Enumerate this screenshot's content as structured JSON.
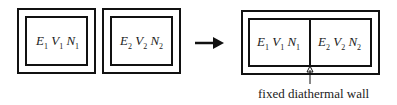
{
  "diagram": {
    "left_systems": [
      {
        "E": "E",
        "E_sub": "1",
        "V": "V",
        "V_sub": "1",
        "N": "N",
        "N_sub": "1"
      },
      {
        "E": "E",
        "E_sub": "2",
        "V": "V",
        "V_sub": "2",
        "N": "N",
        "N_sub": "2"
      }
    ],
    "combined_system": [
      {
        "E": "E",
        "E_sub": "1",
        "V": "V",
        "V_sub": "1",
        "N": "N",
        "N_sub": "1"
      },
      {
        "E": "E",
        "E_sub": "2",
        "V": "V",
        "V_sub": "2",
        "N": "N",
        "N_sub": "2"
      }
    ],
    "wall_caption": "fixed diathermal wall",
    "arrow": "right-arrow"
  }
}
